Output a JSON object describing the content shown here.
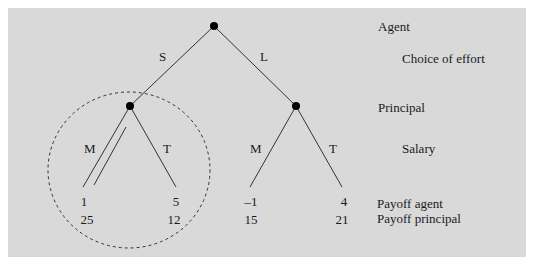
{
  "diagram": {
    "type": "game-tree",
    "right_labels": {
      "agent": "Agent",
      "choice_of_effort": "Choice of effort",
      "principal": "Principal",
      "salary": "Salary",
      "payoff_agent": "Payoff agent",
      "payoff_principal": "Payoff principal"
    },
    "root": {
      "player": "Agent",
      "branches": [
        {
          "label": "S",
          "node": {
            "player": "Principal",
            "branches": [
              {
                "label": "M",
                "payoff_agent": "1",
                "payoff_principal": "25",
                "highlighted": true
              },
              {
                "label": "T",
                "payoff_agent": "5",
                "payoff_principal": "12"
              }
            ]
          }
        },
        {
          "label": "L",
          "node": {
            "player": "Principal",
            "branches": [
              {
                "label": "M",
                "payoff_agent": "–1",
                "payoff_principal": "15"
              },
              {
                "label": "T",
                "payoff_agent": "4",
                "payoff_principal": "21"
              }
            ]
          }
        }
      ]
    },
    "subgame_marker": "dashed-circle around left principal subtree",
    "colors": {
      "background": "#d9d9d9",
      "lines": "#333333",
      "nodes": "#000000"
    }
  },
  "labels": {
    "S": "S",
    "L": "L",
    "left_M": "M",
    "left_T": "T",
    "right_M": "M",
    "right_T": "T",
    "p1_agent": "1",
    "p1_principal": "25",
    "p2_agent": "5",
    "p2_principal": "12",
    "p3_agent": "–1",
    "p3_principal": "15",
    "p4_agent": "4",
    "p4_principal": "21"
  }
}
